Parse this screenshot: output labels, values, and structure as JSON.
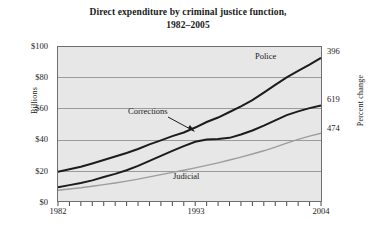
{
  "chart_data": {
    "type": "line",
    "title": "Direct expenditure by criminal justice function, 1982–2005",
    "title_line1": "Direct expenditure by criminal justice function,",
    "title_line2": "1982–2005",
    "xlabel": "",
    "ylabel": "Billions",
    "y2label": "Percent change",
    "xlim": [
      1982,
      2005
    ],
    "ylim": [
      0,
      100
    ],
    "grid": true,
    "legend_position": "inline-annotations",
    "yticks": [
      "$0",
      "$20",
      "$40",
      "$60",
      "$80",
      "$100"
    ],
    "ytick_values": [
      0,
      20,
      40,
      60,
      80,
      100
    ],
    "xticks": [
      "1982",
      "1993",
      "2004"
    ],
    "xtick_values": [
      1982,
      1993,
      2004
    ],
    "x": [
      1982,
      1983,
      1984,
      1985,
      1986,
      1987,
      1988,
      1989,
      1990,
      1991,
      1992,
      1993,
      1994,
      1995,
      1996,
      1997,
      1998,
      1999,
      2000,
      2001,
      2002,
      2003,
      2004,
      2005
    ],
    "series": [
      {
        "name": "Police",
        "color": "#1c1c1c",
        "end_label": "396",
        "end_value": 93,
        "start_value": 19,
        "values": [
          19.0,
          20.6,
          22.3,
          24.4,
          26.6,
          28.9,
          31.2,
          33.8,
          36.8,
          39.4,
          42.1,
          44.5,
          47.7,
          51.3,
          54.2,
          57.8,
          61.5,
          65.5,
          70.4,
          75.4,
          80.3,
          84.5,
          88.5,
          93.0
        ]
      },
      {
        "name": "Corrections",
        "color": "#1c1c1c",
        "end_label": "619",
        "end_value": 62,
        "start_value": 9,
        "values": [
          9.0,
          10.3,
          11.7,
          13.4,
          15.6,
          17.6,
          20.0,
          22.8,
          26.1,
          29.3,
          32.5,
          35.6,
          38.5,
          40.0,
          40.3,
          41.0,
          43.2,
          45.8,
          48.9,
          52.3,
          55.8,
          58.2,
          60.3,
          62.0
        ]
      },
      {
        "name": "Judicial",
        "color": "#9d9d9d",
        "end_label": "474",
        "end_value": 44,
        "start_value": 7,
        "values": [
          7.0,
          7.8,
          8.6,
          9.6,
          10.6,
          11.7,
          12.9,
          14.2,
          15.7,
          17.1,
          18.6,
          20.0,
          21.5,
          23.1,
          24.8,
          26.6,
          28.5,
          30.5,
          32.6,
          35.0,
          37.6,
          40.0,
          42.1,
          44.0
        ]
      }
    ],
    "annotations": [
      {
        "text": "Corrections",
        "kind": "arrow-callout",
        "target_series": "Corrections"
      },
      {
        "text": "Police",
        "kind": "inline-label",
        "target_series": "Police"
      },
      {
        "text": "Judicial",
        "kind": "inline-label",
        "target_series": "Judicial"
      }
    ]
  }
}
